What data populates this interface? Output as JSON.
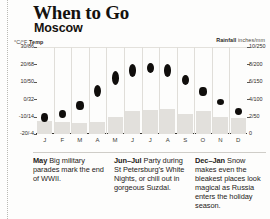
{
  "header": {
    "title": "When to Go",
    "subtitle": "Moscow"
  },
  "axes": {
    "temp_label_units": "°C/°F",
    "temp_label_name": "Temp",
    "rain_label_name": "Rainfall",
    "rain_label_units": "inches/mm"
  },
  "chart_data": {
    "type": "bar",
    "subtitle": "Moscow",
    "xlabel": "",
    "ylabel": "Temp (°C/°F)",
    "y2label": "Rainfall (inches/mm)",
    "grid": true,
    "legend": "none",
    "categories": [
      "J",
      "F",
      "M",
      "A",
      "M",
      "J",
      "J",
      "A",
      "S",
      "O",
      "N",
      "D"
    ],
    "y_left_ticks": [
      "30/86",
      "20/68",
      "10/50",
      "0/32",
      "-10/14",
      "-20/-4"
    ],
    "y_left_values": [
      30,
      20,
      10,
      0,
      -10,
      -20
    ],
    "ylim": [
      -20,
      30
    ],
    "y_right_ticks": [
      "10/250",
      "8/200",
      "6/150",
      "4/100",
      "2/50",
      "0"
    ],
    "y_right_values": [
      10,
      8,
      6,
      4,
      2,
      0
    ],
    "y2lim": [
      0,
      10
    ],
    "series": [
      {
        "name": "Temperature range (°C)",
        "type": "range-marker",
        "low": [
          -13,
          -11,
          -6,
          1,
          8,
          13,
          15,
          13,
          8,
          2,
          -3,
          -9
        ],
        "high": [
          -8,
          -6,
          -1,
          8,
          16,
          20,
          21,
          20,
          14,
          7,
          0,
          -5
        ]
      },
      {
        "name": "Rainfall (inches)",
        "type": "bar",
        "values": [
          1.5,
          1.4,
          1.3,
          1.4,
          1.9,
          2.6,
          2.8,
          2.9,
          2.3,
          2.6,
          2.0,
          1.8
        ]
      }
    ]
  },
  "captions": [
    {
      "months": "May",
      "text": "Big military parades mark the end of WWII."
    },
    {
      "months": "Jun–Jul",
      "text": "Party during St Petersburg’s White Nights, or chill out in gorgeous Suzdal."
    },
    {
      "months": "Dec–Jan",
      "text": "Snow makes even the bleakest places look magical as Russia enters the holiday season."
    }
  ]
}
